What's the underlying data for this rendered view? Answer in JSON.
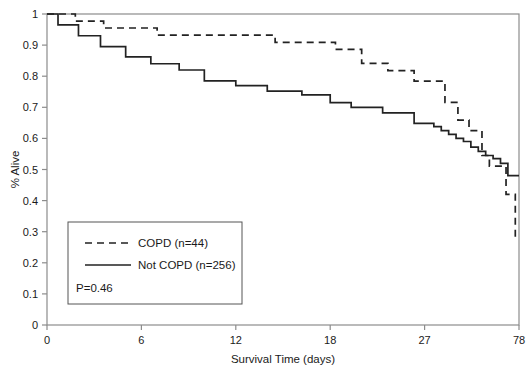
{
  "chart_data": {
    "type": "line",
    "title": "",
    "xlabel": "Survival Time (days)",
    "ylabel": "% Alive",
    "xticks": [
      "0",
      "6",
      "12",
      "18",
      "27",
      "78"
    ],
    "xtick_values": [
      0,
      6,
      12,
      18,
      27,
      78
    ],
    "yticks": [
      "0",
      "0.1",
      "0.2",
      "0.3",
      "0.4",
      "0.5",
      "0.6",
      "0.7",
      "0.8",
      "0.9",
      "1"
    ],
    "ytick_values": [
      0,
      0.1,
      0.2,
      0.3,
      0.4,
      0.5,
      0.6,
      0.7,
      0.8,
      0.9,
      1
    ],
    "ylim": [
      0,
      1
    ],
    "xlim": [
      0,
      78
    ],
    "x_scale": "ordinal-spaced",
    "grid": false,
    "legend_position": "lower-left-inset",
    "annotations": [
      "P=0.46"
    ],
    "series": [
      {
        "name": "COPD (n=44)",
        "style": "dashed",
        "color": "#222222",
        "n": 44,
        "step": "post",
        "points": [
          [
            0.0,
            1.0
          ],
          [
            1.8,
            1.0
          ],
          [
            1.8,
            0.977
          ],
          [
            3.6,
            0.977
          ],
          [
            3.6,
            0.955
          ],
          [
            7.0,
            0.955
          ],
          [
            7.0,
            0.932
          ],
          [
            14.5,
            0.932
          ],
          [
            14.5,
            0.909
          ],
          [
            18.5,
            0.909
          ],
          [
            18.5,
            0.886
          ],
          [
            21.0,
            0.886
          ],
          [
            21.0,
            0.841
          ],
          [
            23.5,
            0.841
          ],
          [
            23.5,
            0.818
          ],
          [
            26.0,
            0.818
          ],
          [
            26.0,
            0.784
          ],
          [
            38.0,
            0.784
          ],
          [
            38.0,
            0.716
          ],
          [
            45.0,
            0.716
          ],
          [
            45.0,
            0.659
          ],
          [
            51.0,
            0.659
          ],
          [
            51.0,
            0.625
          ],
          [
            58.0,
            0.625
          ],
          [
            58.0,
            0.545
          ],
          [
            62.0,
            0.545
          ],
          [
            62.0,
            0.511
          ],
          [
            71.0,
            0.511
          ],
          [
            71.0,
            0.42
          ],
          [
            76.0,
            0.42
          ],
          [
            76.0,
            0.28
          ],
          [
            78.0,
            0.28
          ]
        ]
      },
      {
        "name": "Not COPD (n=256)",
        "style": "solid",
        "color": "#222222",
        "n": 256,
        "step": "post",
        "points": [
          [
            0.0,
            1.0
          ],
          [
            0.7,
            1.0
          ],
          [
            0.7,
            0.965
          ],
          [
            2.0,
            0.965
          ],
          [
            2.0,
            0.93
          ],
          [
            3.4,
            0.93
          ],
          [
            3.4,
            0.895
          ],
          [
            5.0,
            0.895
          ],
          [
            5.0,
            0.862
          ],
          [
            6.6,
            0.862
          ],
          [
            6.6,
            0.84
          ],
          [
            8.4,
            0.84
          ],
          [
            8.4,
            0.82
          ],
          [
            10.0,
            0.82
          ],
          [
            10.0,
            0.785
          ],
          [
            12.0,
            0.785
          ],
          [
            12.0,
            0.77
          ],
          [
            14.0,
            0.77
          ],
          [
            14.0,
            0.752
          ],
          [
            16.2,
            0.752
          ],
          [
            16.2,
            0.74
          ],
          [
            18.0,
            0.74
          ],
          [
            18.0,
            0.715
          ],
          [
            20.0,
            0.715
          ],
          [
            20.0,
            0.7
          ],
          [
            23.0,
            0.7
          ],
          [
            23.0,
            0.682
          ],
          [
            26.0,
            0.682
          ],
          [
            26.0,
            0.648
          ],
          [
            32.0,
            0.648
          ],
          [
            32.0,
            0.638
          ],
          [
            36.0,
            0.638
          ],
          [
            36.0,
            0.625
          ],
          [
            40.0,
            0.625
          ],
          [
            40.0,
            0.613
          ],
          [
            44.0,
            0.613
          ],
          [
            44.0,
            0.6
          ],
          [
            48.0,
            0.6
          ],
          [
            48.0,
            0.59
          ],
          [
            52.0,
            0.59
          ],
          [
            52.0,
            0.572
          ],
          [
            56.0,
            0.572
          ],
          [
            56.0,
            0.558
          ],
          [
            60.0,
            0.558
          ],
          [
            60.0,
            0.545
          ],
          [
            64.0,
            0.545
          ],
          [
            64.0,
            0.535
          ],
          [
            68.0,
            0.535
          ],
          [
            68.0,
            0.52
          ],
          [
            72.0,
            0.52
          ],
          [
            72.0,
            0.48
          ],
          [
            78.0,
            0.48
          ]
        ]
      }
    ]
  },
  "legend": {
    "items": [
      {
        "label": "COPD (n=44)",
        "style": "dashed"
      },
      {
        "label": "Not COPD (n=256)",
        "style": "solid"
      }
    ],
    "pvalue": "P=0.46"
  },
  "axes": {
    "x_title": "Survival Time (days)",
    "y_title": "% Alive"
  },
  "colors": {
    "line": "#222222",
    "frame": "#8c8c8c",
    "text": "#1a1a1a",
    "background": "#ffffff"
  }
}
